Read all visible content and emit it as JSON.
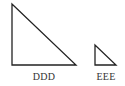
{
  "diagram": {
    "shapes": [
      {
        "type": "right-triangle",
        "label": "DDD",
        "points": [
          [
            12,
            4
          ],
          [
            12,
            65
          ],
          [
            76,
            65
          ]
        ]
      },
      {
        "type": "right-triangle",
        "label": "EEE",
        "points": [
          [
            95,
            45
          ],
          [
            95,
            65
          ],
          [
            116,
            65
          ]
        ]
      }
    ],
    "stroke_color": "#222222"
  }
}
